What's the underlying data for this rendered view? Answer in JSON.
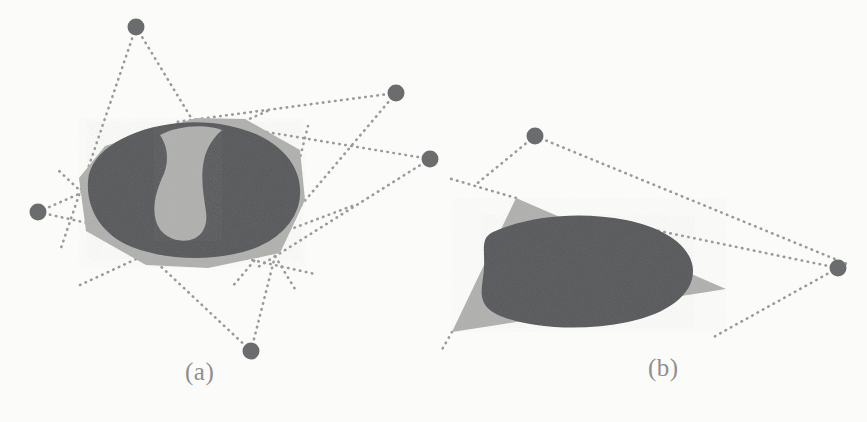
{
  "figure": {
    "type": "geometry-diagram",
    "background_color": "#fbfbfa",
    "panels": [
      {
        "id": "a",
        "label": "(a)",
        "label_position": {
          "x": 185,
          "y": 358
        },
        "description": "Convex hull polygon (light gray) containing a kidney-shaped non-convex dark region, with dotted tangent lines radiating from five sample points",
        "hull": {
          "name": "convex-hull-polygon",
          "fill": "#b0b0ae",
          "points": "79,178 105,146 196,118 245,119 300,150 305,200 280,253 208,268 146,265 86,231"
        },
        "blob": {
          "name": "kidney-shaped-region",
          "fill": "#56585a",
          "path": "M 88,181 C 90,150 130,128 178,123 C 208,120 236,125 258,135 C 288,149 302,172 300,196 C 298,221 277,243 243,252 C 205,262 163,259 132,247 C 102,235 86,209 88,181 Z"
        },
        "notch": {
          "name": "interior-light-notch",
          "fill": "#b0b0ae",
          "path": "M 160,135 C 170,150 168,166 162,178 C 156,192 152,207 156,221 C 160,236 176,243 190,240 C 202,237 208,226 206,212 C 204,196 200,178 204,160 C 207,146 215,136 222,130 C 205,124 180,125 160,135 Z"
        },
        "points": [
          {
            "name": "sample-point-1",
            "x": 136,
            "y": 27,
            "r": 8.5
          },
          {
            "name": "sample-point-2",
            "x": 396,
            "y": 93,
            "r": 8.5
          },
          {
            "name": "sample-point-3",
            "x": 430,
            "y": 159,
            "r": 8.5
          },
          {
            "name": "sample-point-4",
            "x": 38,
            "y": 212,
            "r": 8.5
          },
          {
            "name": "sample-point-5",
            "x": 251,
            "y": 351,
            "r": 8.5
          }
        ],
        "tangent_lines": [
          {
            "name": "tangent-line",
            "x1": 136,
            "y1": 27,
            "x2": 60,
            "y2": 251
          },
          {
            "name": "tangent-line",
            "x1": 136,
            "y1": 27,
            "x2": 295,
            "y2": 289
          },
          {
            "name": "tangent-line",
            "x1": 396,
            "y1": 93,
            "x2": 176,
            "y2": 122
          },
          {
            "name": "tangent-line",
            "x1": 396,
            "y1": 93,
            "x2": 232,
            "y2": 287
          },
          {
            "name": "tangent-line",
            "x1": 430,
            "y1": 159,
            "x2": 218,
            "y2": 124
          },
          {
            "name": "tangent-line",
            "x1": 430,
            "y1": 159,
            "x2": 258,
            "y2": 267
          },
          {
            "name": "tangent-line",
            "x1": 38,
            "y1": 212,
            "x2": 272,
            "y2": 109
          },
          {
            "name": "tangent-line",
            "x1": 38,
            "y1": 212,
            "x2": 315,
            "y2": 274
          },
          {
            "name": "tangent-line",
            "x1": 251,
            "y1": 351,
            "x2": 57,
            "y2": 169
          },
          {
            "name": "tangent-line",
            "x1": 251,
            "y1": 351,
            "x2": 308,
            "y2": 126
          },
          {
            "name": "tangent-line",
            "x1": 80,
            "y1": 285,
            "x2": 171,
            "y2": 243
          },
          {
            "name": "tangent-line",
            "x1": 352,
            "y1": 206,
            "x2": 283,
            "y2": 232
          }
        ]
      },
      {
        "id": "b",
        "label": "(b)",
        "label_position": {
          "x": 648,
          "y": 354
        },
        "description": "Light gray triangle with a dark convex oval region overlapping it, and dotted tangent lines from two sample points",
        "hull": {
          "name": "triangle-polygon",
          "fill": "#b0b0ae",
          "points": "516,198 726,289 452,332"
        },
        "blob": {
          "name": "oval-region",
          "fill": "#56585a",
          "path": "M 493,232 C 534,214 584,212 626,220 C 666,228 692,247 693,270 C 694,294 668,314 628,322 C 585,331 535,329 503,317 C 473,306 483,288 484,268 C 485,250 480,238 493,232 Z"
        },
        "points": [
          {
            "name": "sample-point-1",
            "x": 535,
            "y": 136,
            "r": 8.5
          },
          {
            "name": "sample-point-2",
            "x": 838,
            "y": 268,
            "r": 8.5
          }
        ],
        "tangent_lines": [
          {
            "name": "tangent-line",
            "x1": 535,
            "y1": 136,
            "x2": 474,
            "y2": 186
          },
          {
            "name": "tangent-line",
            "x1": 535,
            "y1": 136,
            "x2": 847,
            "y2": 264
          },
          {
            "name": "tangent-line",
            "x1": 838,
            "y1": 268,
            "x2": 640,
            "y2": 227
          },
          {
            "name": "tangent-line",
            "x1": 838,
            "y1": 268,
            "x2": 710,
            "y2": 339
          },
          {
            "name": "tangent-line",
            "x1": 516,
            "y1": 198,
            "x2": 448,
            "y2": 178
          },
          {
            "name": "tangent-line",
            "x1": 452,
            "y1": 332,
            "x2": 440,
            "y2": 353
          }
        ]
      }
    ],
    "colors": {
      "dark_region": "#56585a",
      "light_region": "#b0b0ae",
      "point": "#6b6c6e",
      "dotted_line": "#9a9a99",
      "label_text": "#8f8f8f",
      "background": "#fbfbfa"
    }
  }
}
